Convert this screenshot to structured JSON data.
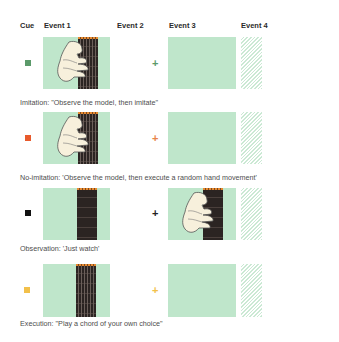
{
  "headers": {
    "cue": "Cue",
    "event1": "Event 1",
    "event2": "Event 2",
    "event3": "Event 3",
    "event4": "Event 4"
  },
  "colors": {
    "panel": "#bfe6cb",
    "fretboard": "#2b2422",
    "nut": "#e88a30",
    "hand": "#f7f0dc"
  },
  "conditions": [
    {
      "name": "imitation",
      "cue_color": "#5b9a6a",
      "fixation": "+",
      "fixation_color": "#5b9a6a",
      "event1": "hand-on-fretboard",
      "event3": "blank",
      "caption": "Imitation: \"Observe the model, then imitate\""
    },
    {
      "name": "no-imitation",
      "cue_color": "#e85a2c",
      "fixation": "+",
      "fixation_color": "#e8834a",
      "event1": "hand-on-fretboard",
      "event3": "blank",
      "caption": "No-imitation: 'Observe the model, then execute a random hand movement'"
    },
    {
      "name": "observation",
      "cue_color": "#111111",
      "fixation": "+",
      "fixation_color": "#222222",
      "event1": "fretboard",
      "event3": "hand-on-fretboard",
      "caption": "Observation: 'Just watch'"
    },
    {
      "name": "execution",
      "cue_color": "#f2c04a",
      "fixation": "+",
      "fixation_color": "#f2c04a",
      "event1": "fretboard",
      "event3": "blank",
      "caption": "Execution: \"Play a chord of your own choice\""
    }
  ]
}
